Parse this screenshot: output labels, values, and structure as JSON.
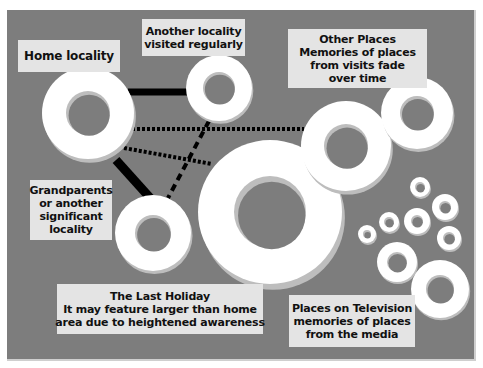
{
  "colors": {
    "background": "#ffffff",
    "panel": "#7d7d7d",
    "label_bg": "#e4e4e4",
    "ring_face": "#ffffff",
    "ring_shadow": "#bdbdbd",
    "hole": "#7d7d7d",
    "line": "#000000",
    "text": "#111111"
  },
  "labels": {
    "home": {
      "lines": [
        "Home locality"
      ]
    },
    "another": {
      "lines": [
        "Another locality",
        "visited regularly"
      ]
    },
    "other_places": {
      "lines": [
        "Other Places",
        "Memories of places",
        "from visits fade",
        "over time"
      ]
    },
    "grandparents": {
      "lines": [
        "Grandparents",
        "or another",
        "significant",
        "locality"
      ]
    },
    "last_holiday": {
      "lines": [
        "The Last Holiday",
        "It may feature larger than home",
        "area due to heightened awareness"
      ]
    },
    "television": {
      "lines": [
        "Places on Television",
        "memories of places",
        "from the media"
      ]
    }
  },
  "rings": [
    {
      "id": "home",
      "cx": 88,
      "cy": 113,
      "r": 46,
      "hole": 22
    },
    {
      "id": "another",
      "cx": 219,
      "cy": 88,
      "r": 33,
      "hole": 16
    },
    {
      "id": "grandparents",
      "cx": 153,
      "cy": 233,
      "r": 38,
      "hole": 18
    },
    {
      "id": "last-holiday",
      "cx": 270,
      "cy": 212,
      "r": 72,
      "hole": 36
    },
    {
      "id": "other-1",
      "cx": 346,
      "cy": 146,
      "r": 45,
      "hole": 22
    },
    {
      "id": "other-2",
      "cx": 417,
      "cy": 113,
      "r": 36,
      "hole": 17
    },
    {
      "id": "tv-1",
      "cx": 420,
      "cy": 187,
      "r": 10,
      "hole": 5
    },
    {
      "id": "tv-2",
      "cx": 445,
      "cy": 207,
      "r": 13,
      "hole": 6
    },
    {
      "id": "tv-3",
      "cx": 417,
      "cy": 221,
      "r": 13,
      "hole": 6
    },
    {
      "id": "tv-4",
      "cx": 389,
      "cy": 222,
      "r": 10,
      "hole": 5
    },
    {
      "id": "tv-5",
      "cx": 367,
      "cy": 234,
      "r": 9,
      "hole": 4
    },
    {
      "id": "tv-6",
      "cx": 449,
      "cy": 238,
      "r": 12,
      "hole": 6
    },
    {
      "id": "tv-7",
      "cx": 397,
      "cy": 262,
      "r": 20,
      "hole": 10
    },
    {
      "id": "tv-8",
      "cx": 440,
      "cy": 289,
      "r": 29,
      "hole": 14
    }
  ],
  "connections": [
    {
      "id": "home-another",
      "style": "solid",
      "x1": 128,
      "y1": 92,
      "x2": 190,
      "y2": 92,
      "width": 7
    },
    {
      "id": "home-grandparents",
      "style": "solid",
      "x1": 116,
      "y1": 160,
      "x2": 152,
      "y2": 200,
      "width": 9
    },
    {
      "id": "home-other",
      "style": "dotted",
      "x1": 132,
      "y1": 129,
      "x2": 304,
      "y2": 129,
      "width": 4
    },
    {
      "id": "home-holiday",
      "style": "dotted",
      "x1": 124,
      "y1": 148,
      "x2": 212,
      "y2": 164,
      "width": 4
    },
    {
      "id": "another-grandparents",
      "style": "dashed",
      "x1": 209,
      "y1": 121,
      "x2": 168,
      "y2": 198,
      "width": 4
    }
  ]
}
